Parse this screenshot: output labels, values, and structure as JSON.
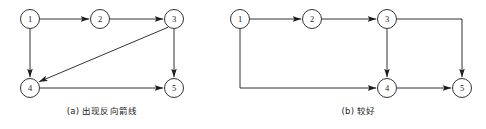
{
  "figure": {
    "background_color": "#ffffff",
    "line_color": "#1c1c1c",
    "panels": [
      {
        "id": "panel-a",
        "caption": "(a) 出现反向箭线",
        "nodes": [
          {
            "id": "a1",
            "label": "1",
            "cx": 30,
            "cy": 19,
            "r": 9.5
          },
          {
            "id": "a2",
            "label": "2",
            "cx": 100,
            "cy": 19,
            "r": 9.5
          },
          {
            "id": "a3",
            "label": "3",
            "cx": 174,
            "cy": 19,
            "r": 9.5
          },
          {
            "id": "a4",
            "label": "4",
            "cx": 30,
            "cy": 88,
            "r": 9.5
          },
          {
            "id": "a5",
            "label": "5",
            "cx": 174,
            "cy": 88,
            "r": 9.5
          }
        ],
        "edges": [
          {
            "from": "1",
            "to": "2",
            "kind": "straight-horizontal"
          },
          {
            "from": "2",
            "to": "3",
            "kind": "straight-horizontal"
          },
          {
            "from": "1",
            "to": "4",
            "kind": "straight-vertical"
          },
          {
            "from": "3",
            "to": "4",
            "kind": "diagonal-backward"
          },
          {
            "from": "3",
            "to": "5",
            "kind": "straight-vertical"
          },
          {
            "from": "4",
            "to": "5",
            "kind": "straight-horizontal"
          }
        ]
      },
      {
        "id": "panel-b",
        "caption": "(b) 较好",
        "nodes": [
          {
            "id": "b1",
            "label": "1",
            "cx": 240,
            "cy": 19,
            "r": 9.5
          },
          {
            "id": "b2",
            "label": "2",
            "cx": 312,
            "cy": 19,
            "r": 9.5
          },
          {
            "id": "b3",
            "label": "3",
            "cx": 387,
            "cy": 19,
            "r": 9.5
          },
          {
            "id": "b4",
            "label": "4",
            "cx": 387,
            "cy": 88,
            "r": 9.5
          },
          {
            "id": "b5",
            "label": "5",
            "cx": 462,
            "cy": 88,
            "r": 9.5
          }
        ],
        "edges": [
          {
            "from": "1",
            "to": "2",
            "kind": "straight-horizontal"
          },
          {
            "from": "2",
            "to": "3",
            "kind": "straight-horizontal"
          },
          {
            "from": "1",
            "to": "4",
            "kind": "orthogonal-down-right"
          },
          {
            "from": "3",
            "to": "4",
            "kind": "straight-vertical"
          },
          {
            "from": "3",
            "to": "5",
            "kind": "orthogonal-right-down"
          },
          {
            "from": "4",
            "to": "5",
            "kind": "straight-horizontal"
          }
        ]
      }
    ]
  }
}
